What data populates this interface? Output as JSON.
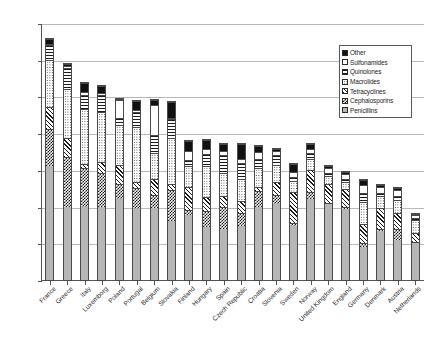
{
  "chart_data": {
    "type": "bar",
    "subtype": "stacked-column",
    "title": "",
    "xlabel": "",
    "ylabel": "",
    "ylim": [
      0,
      35
    ],
    "ytick_step": 5,
    "ytick_labels": [
      "0.00",
      "5.00",
      "10.00",
      "15.00",
      "20.00",
      "25.00",
      "30.00",
      "35.00"
    ],
    "grid": true,
    "grid_axis": "y",
    "legend_position": "top-right-inside",
    "categories": [
      "France",
      "Greece",
      "Italy",
      "Luxemborg",
      "Poland",
      "Portugal",
      "Belgium",
      "Slovakia",
      "Finland",
      "Hungary",
      "Spain",
      "Czech Republic",
      "Croatia",
      "Slovenia",
      "Sweden",
      "Norway",
      "United Kingdom",
      "England",
      "Germany",
      "Denmark",
      "Austria",
      "Netherlands"
    ],
    "series": [
      {
        "name": "Penicillins",
        "pattern": "light-gray-solid",
        "color": "#b6b6b6",
        "values": [
          15.5,
          10.0,
          9.9,
          9.9,
          11.1,
          9.7,
          9.8,
          8.0,
          8.9,
          7.2,
          6.9,
          7.4,
          9.9,
          10.3,
          7.3,
          11.0,
          10.3,
          9.7,
          4.5,
          6.7,
          5.5,
          5.0
        ]
      },
      {
        "name": "Cephalosporins",
        "pattern": "checkerboard-dark",
        "color": "#1c1c1c",
        "values": [
          5.0,
          6.7,
          5.3,
          4.7,
          2.0,
          2.8,
          1.8,
          4.3,
          0.6,
          2.2,
          3.1,
          1.7,
          2.2,
          1.3,
          0.5,
          1.0,
          0.2,
          0.2,
          0.6,
          0.3,
          1.4,
          0.2
        ]
      },
      {
        "name": "Tetracyclines",
        "pattern": "diagonal-hatch",
        "color": "#1c1c1c",
        "values": [
          3.0,
          2.6,
          0.6,
          1.5,
          2.6,
          0.9,
          2.2,
          0.8,
          3.2,
          1.9,
          1.5,
          1.7,
          0.6,
          1.7,
          4.2,
          3.0,
          2.6,
          2.5,
          2.6,
          2.8,
          2.2,
          1.2
        ]
      },
      {
        "name": "Macrolides",
        "pattern": "dotted",
        "color": "#3a3a3a",
        "values": [
          6.5,
          6.7,
          7.5,
          6.8,
          5.4,
          7.5,
          3.5,
          6.3,
          2.9,
          4.2,
          3.1,
          3.0,
          2.6,
          2.4,
          1.5,
          1.5,
          1.1,
          1.0,
          2.9,
          1.6,
          1.8,
          1.8
        ]
      },
      {
        "name": "Quinolones",
        "pattern": "horizontal-lines",
        "color": "#1c1c1c",
        "values": [
          2.0,
          2.9,
          1.9,
          2.3,
          1.0,
          2.0,
          2.4,
          2.5,
          0.7,
          1.7,
          2.5,
          2.2,
          1.2,
          1.3,
          0.6,
          0.8,
          0.4,
          0.4,
          1.3,
          0.5,
          0.6,
          0.3
        ]
      },
      {
        "name": "Sulfonamides",
        "pattern": "white",
        "color": "#ffffff",
        "values": [
          0.2,
          0.2,
          0.4,
          0.3,
          2.4,
          0.3,
          4.2,
          0.2,
          1.3,
          0.7,
          0.5,
          0.5,
          1.0,
          0.6,
          0.6,
          0.6,
          0.7,
          0.6,
          1.0,
          0.8,
          0.8,
          0.3
        ]
      },
      {
        "name": "Other",
        "pattern": "solid-black",
        "color": "#111111",
        "values": [
          0.7,
          0.3,
          1.2,
          1.0,
          0.2,
          1.2,
          0.6,
          2.2,
          1.4,
          1.2,
          1.0,
          2.1,
          0.8,
          0.2,
          1.1,
          0.6,
          0.2,
          0.3,
          0.8,
          0.3,
          0.2,
          0.1
        ]
      }
    ],
    "totals": [
      32.9,
      29.4,
      26.8,
      26.5,
      24.7,
      24.4,
      24.5,
      24.3,
      19.0,
      19.1,
      18.6,
      18.6,
      18.3,
      17.8,
      15.8,
      18.5,
      15.5,
      14.7,
      13.7,
      13.0,
      12.5,
      8.9
    ]
  },
  "legend": {
    "items": [
      {
        "label": "Other"
      },
      {
        "label": "Sulfonamides"
      },
      {
        "label": "Quinolones"
      },
      {
        "label": "Macrolides"
      },
      {
        "label": "Tetracyclines"
      },
      {
        "label": "Cephalosporins"
      },
      {
        "label": "Penicillins"
      }
    ]
  }
}
